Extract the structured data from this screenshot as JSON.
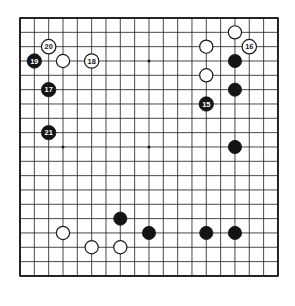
{
  "diagram": {
    "kind": "go-board-diagram",
    "board_size": 19,
    "background_color": "#ffffff",
    "line_color": "#1a1a1a",
    "border_color": "#1a1a1a",
    "black_color": "#141414",
    "white_color": "#ffffff",
    "white_outline_color": "#1a1a1a",
    "label_on_black_color": "#ffffff",
    "label_on_white_color": "#1a1a1a",
    "geometry": {
      "origin_x": 20,
      "origin_y": 18,
      "spacing": 14.33,
      "stone_radius": 6.6,
      "label_stone_radius": 7.2,
      "star_radius": 1.5,
      "line_width": 0.8,
      "border_width": 1.6
    },
    "star_points": [
      {
        "col": 3,
        "row": 3
      },
      {
        "col": 9,
        "row": 3
      },
      {
        "col": 15,
        "row": 3
      },
      {
        "col": 3,
        "row": 9
      },
      {
        "col": 9,
        "row": 9
      },
      {
        "col": 15,
        "row": 9
      },
      {
        "col": 3,
        "row": 15
      },
      {
        "col": 9,
        "row": 15
      },
      {
        "col": 15,
        "row": 15
      }
    ],
    "stones": [
      {
        "id": "w-c15-r1",
        "color": "white",
        "col": 15,
        "row": 1,
        "label": ""
      },
      {
        "id": "w-c13-r2",
        "color": "white",
        "col": 13,
        "row": 2,
        "label": ""
      },
      {
        "id": "w-16",
        "color": "white",
        "col": 16,
        "row": 2,
        "label": "16"
      },
      {
        "id": "w-20",
        "color": "white",
        "col": 2,
        "row": 2,
        "label": "20"
      },
      {
        "id": "b-19",
        "color": "black",
        "col": 1,
        "row": 3,
        "label": "19"
      },
      {
        "id": "w-c3-r3",
        "color": "white",
        "col": 3,
        "row": 3,
        "label": ""
      },
      {
        "id": "w-18",
        "color": "white",
        "col": 5,
        "row": 3,
        "label": "18"
      },
      {
        "id": "b-c15-r3",
        "color": "black",
        "col": 15,
        "row": 3,
        "label": ""
      },
      {
        "id": "w-c13-r4",
        "color": "white",
        "col": 13,
        "row": 4,
        "label": ""
      },
      {
        "id": "b-17",
        "color": "black",
        "col": 2,
        "row": 5,
        "label": "17"
      },
      {
        "id": "b-c15-r5",
        "color": "black",
        "col": 15,
        "row": 5,
        "label": ""
      },
      {
        "id": "b-15",
        "color": "black",
        "col": 13,
        "row": 6,
        "label": "15"
      },
      {
        "id": "b-21",
        "color": "black",
        "col": 2,
        "row": 8,
        "label": "21"
      },
      {
        "id": "b-c15-r9",
        "color": "black",
        "col": 15,
        "row": 9,
        "label": ""
      },
      {
        "id": "b-c7-r14",
        "color": "black",
        "col": 7,
        "row": 14,
        "label": ""
      },
      {
        "id": "w-c3-r15",
        "color": "white",
        "col": 3,
        "row": 15,
        "label": ""
      },
      {
        "id": "b-c9-r15",
        "color": "black",
        "col": 9,
        "row": 15,
        "label": ""
      },
      {
        "id": "b-c13-r15",
        "color": "black",
        "col": 13,
        "row": 15,
        "label": ""
      },
      {
        "id": "b-c15-r15",
        "color": "black",
        "col": 15,
        "row": 15,
        "label": ""
      },
      {
        "id": "w-c5-r16",
        "color": "white",
        "col": 5,
        "row": 16,
        "label": ""
      },
      {
        "id": "w-c7-r16",
        "color": "white",
        "col": 7,
        "row": 16,
        "label": ""
      }
    ],
    "move_labels": [
      "15",
      "16",
      "17",
      "18",
      "19",
      "20",
      "21"
    ]
  }
}
